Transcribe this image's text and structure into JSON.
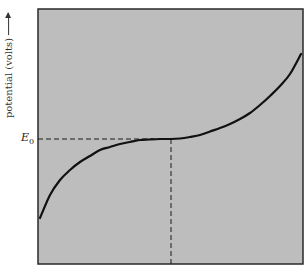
{
  "chart_data": {
    "type": "line",
    "title": "",
    "xlabel": "",
    "ylabel": "potential (volts)",
    "ylabel_arrow": true,
    "grid": false,
    "legend": null,
    "annotations": [
      {
        "label_main": "E",
        "label_sub": "0",
        "meaning": "inflection / equivalence potential",
        "style": "dashed horizontal and vertical reference lines"
      }
    ],
    "series": [
      {
        "name": "titration curve",
        "shape": "S-shaped (cubic) with inflection at E0 near the middle",
        "x_px": [
          40,
          50,
          60,
          70,
          80,
          90,
          100,
          110,
          120,
          130,
          140,
          150,
          160,
          171,
          180,
          190,
          200,
          210,
          220,
          230,
          240,
          250,
          260,
          270,
          280,
          290,
          301
        ],
        "y_px": [
          218,
          195,
          180,
          170,
          162,
          156,
          150,
          147,
          144,
          142,
          140,
          139.5,
          139,
          139,
          138.5,
          137,
          135,
          131.5,
          128,
          124,
          119,
          113,
          105,
          96,
          86,
          74,
          54
        ]
      }
    ],
    "plot_area_px": {
      "left": 38,
      "top": 9,
      "right": 303,
      "bottom": 264
    },
    "inflection_px": {
      "x": 171,
      "y": 139
    },
    "colors": {
      "background": "#bdbdbd",
      "frame": "#2a2a2a",
      "curve": "#111111",
      "dash": "#1a1a1a",
      "page": "#ffffff"
    }
  },
  "labels": {
    "y_axis": "potential (volts)",
    "e0_main": "E",
    "e0_sub": "0"
  }
}
